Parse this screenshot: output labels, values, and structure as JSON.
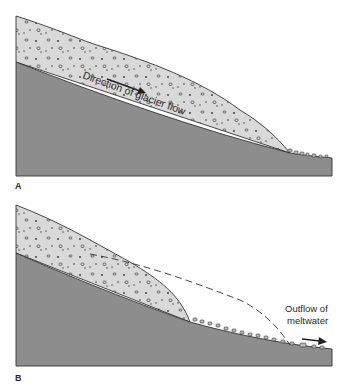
{
  "figure": {
    "panels": [
      {
        "id": "A",
        "label": "A",
        "annotation": "Direction of glacier flow",
        "description": "Glacier advancing down a sloping bedrock, carrying debris"
      },
      {
        "id": "B",
        "label": "B",
        "annotation_line1": "Outflow of",
        "annotation_line2": "meltwater",
        "description": "Glacier retreating; dashed line shows former glacier extent; debris deposited on slope"
      }
    ],
    "colors": {
      "bedrock": "#8d8d8d",
      "glacier_ice": "#d9d9d9",
      "outline": "#333333",
      "text": "#2a2a2a",
      "background": "#ffffff"
    }
  }
}
